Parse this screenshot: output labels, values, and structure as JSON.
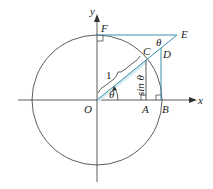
{
  "diagram": {
    "type": "unit-circle-trig",
    "colors": {
      "circle": "#333333",
      "axes": "#333333",
      "accent": "#3a8fa8",
      "fill": "#d6ecf2"
    },
    "labels": {
      "x_axis": "x",
      "y_axis": "y",
      "origin": "O",
      "A": "A",
      "B": "B",
      "C": "C",
      "D": "D",
      "E": "E",
      "F": "F",
      "theta_at_O": "θ",
      "theta_at_E": "θ",
      "radius": "1",
      "sin_label": "sin θ"
    }
  }
}
